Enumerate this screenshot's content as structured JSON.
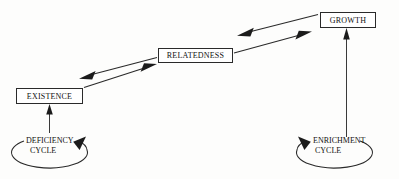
{
  "diagram": {
    "type": "erg-motivation-cycle-diagram",
    "background_color": "#fdfdfc",
    "line_color": "#2a2a2a",
    "nodes": [
      {
        "id": "existence",
        "label": "EXISTENCE"
      },
      {
        "id": "relatedness",
        "label": "RELATEDNESS"
      },
      {
        "id": "growth",
        "label": "GROWTH"
      }
    ],
    "cycles": [
      {
        "id": "deficiency-cycle",
        "label_line1": "DEFICIENCY",
        "label_line2": "CYCLE",
        "loop_direction": "clockwise",
        "feeds_node": "existence"
      },
      {
        "id": "enrichment-cycle",
        "label_line1": "ENRICHMENT",
        "label_line2": "CYCLE",
        "loop_direction": "counter-clockwise",
        "feeds_node": "growth"
      }
    ],
    "connections": [
      {
        "from": "relatedness",
        "to": "existence",
        "style": "thick-solid-arrow"
      },
      {
        "from": "existence",
        "to": "relatedness",
        "style": "thick-solid-arrow"
      },
      {
        "from": "growth",
        "to": "relatedness",
        "style": "thick-solid-arrow"
      },
      {
        "from": "relatedness",
        "to": "growth",
        "style": "thick-solid-arrow"
      },
      {
        "from": "deficiency-cycle",
        "to": "existence",
        "style": "thin-vertical-arrow"
      },
      {
        "from": "enrichment-cycle",
        "to": "growth",
        "style": "thin-vertical-arrow"
      }
    ]
  }
}
